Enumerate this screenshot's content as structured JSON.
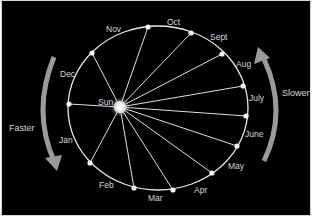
{
  "diagram": {
    "title": "",
    "sun": {
      "label": "Sun",
      "x": 118,
      "y": 106
    },
    "orbit": {
      "cx": 156,
      "cy": 107,
      "rx": 90,
      "ry": 82,
      "color": "#e8e8e8"
    },
    "points": [
      {
        "id": "p-dec",
        "x": 90,
        "y": 52
      },
      {
        "id": "p-nov",
        "x": 146,
        "y": 26
      },
      {
        "id": "p-oct",
        "x": 189,
        "y": 32
      },
      {
        "id": "p-sept",
        "x": 220,
        "y": 53
      },
      {
        "id": "p-aug",
        "x": 241,
        "y": 85
      },
      {
        "id": "p-july",
        "x": 244,
        "y": 115
      },
      {
        "id": "p-june",
        "x": 235,
        "y": 145
      },
      {
        "id": "p-may",
        "x": 210,
        "y": 172
      },
      {
        "id": "p-apr",
        "x": 171,
        "y": 189
      },
      {
        "id": "p-mar",
        "x": 132,
        "y": 187
      },
      {
        "id": "p-feb",
        "x": 88,
        "y": 162
      },
      {
        "id": "p-jan",
        "x": 67,
        "y": 103
      }
    ],
    "month_labels": [
      {
        "text": "Nov",
        "x": 104,
        "y": 31
      },
      {
        "text": "Oct",
        "x": 165,
        "y": 24
      },
      {
        "text": "Sept",
        "x": 208,
        "y": 39
      },
      {
        "text": "Aug",
        "x": 234,
        "y": 66
      },
      {
        "text": "July",
        "x": 247,
        "y": 100
      },
      {
        "text": "June",
        "x": 243,
        "y": 136
      },
      {
        "text": "May",
        "x": 226,
        "y": 168
      },
      {
        "text": "Apr",
        "x": 192,
        "y": 192
      },
      {
        "text": "Mar",
        "x": 146,
        "y": 200
      },
      {
        "text": "Feb",
        "x": 97,
        "y": 187
      },
      {
        "text": "Jan",
        "x": 57,
        "y": 142
      },
      {
        "text": "Dec",
        "x": 58,
        "y": 76
      }
    ],
    "left_arrow": {
      "label": "Faster",
      "direction": "down"
    },
    "right_arrow": {
      "label": "Slower",
      "direction": "up"
    },
    "colors": {
      "background": "#000000",
      "lines": "#e0e0e0",
      "arrows": "#9a9a9a",
      "text": "#d6d6d6",
      "sun": "#ffffff"
    }
  }
}
